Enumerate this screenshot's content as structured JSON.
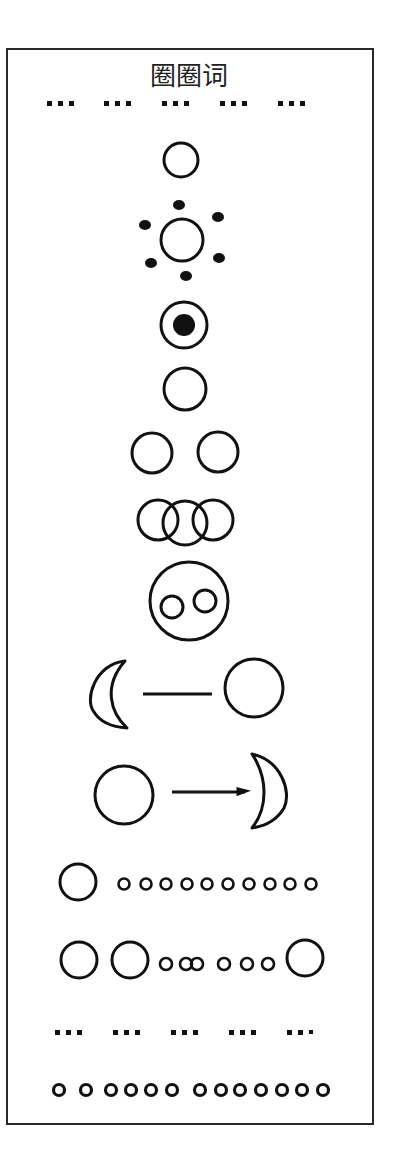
{
  "title": "圈圈词",
  "colors": {
    "ink": "#111111",
    "border": "#2a2a2a",
    "background": "#ffffff"
  },
  "rows": [
    {
      "id": "dot-separator-top",
      "description": "5 groups of 3 small square dots",
      "groups": 5,
      "dots_per_group": 3
    },
    {
      "id": "single-circle",
      "description": "one open circle"
    },
    {
      "id": "sun-circle",
      "description": "open circle surrounded by 6 filled dots",
      "dot_count": 6
    },
    {
      "id": "target-circle",
      "description": "open circle with filled center dot"
    },
    {
      "id": "single-circle-2",
      "description": "one open circle"
    },
    {
      "id": "two-circles",
      "description": "two separate open circles",
      "count": 2
    },
    {
      "id": "three-overlapping-circles",
      "description": "three interlocking open circles",
      "count": 3
    },
    {
      "id": "circle-with-two-inner-circles",
      "description": "large circle enclosing two small circles",
      "inner_count": 2
    },
    {
      "id": "crescent-line-circle",
      "description": "left crescent, line, circle"
    },
    {
      "id": "circle-line-crescent",
      "description": "circle, line, right crescent"
    },
    {
      "id": "big-circle-small-circles",
      "description": "one large circle followed by small circles",
      "small_count": 10
    },
    {
      "id": "big-small-big-circles",
      "description": "two large circles, small circles, one large circle",
      "large_left": 2,
      "small_count": 6,
      "large_right": 1
    },
    {
      "id": "dot-separator-bottom",
      "description": "5 groups of 3 small square dots",
      "groups": 5,
      "dots_per_group": 3
    },
    {
      "id": "small-circles-row",
      "description": "row of small circles",
      "count": 13
    }
  ]
}
